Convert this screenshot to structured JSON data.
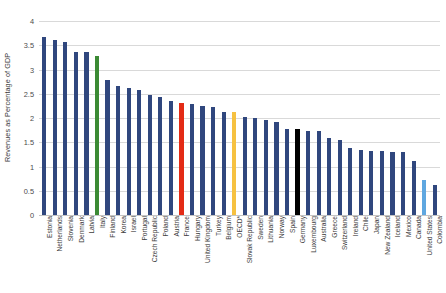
{
  "chart_data": {
    "type": "bar",
    "title": "",
    "subtitle": "",
    "xlabel": "",
    "ylabel": "Revenues as Percentage of GDP",
    "ylim": [
      0,
      4
    ],
    "yticks": [
      "0",
      "0.5",
      "1",
      "1.5",
      "2",
      "2.5",
      "3",
      "3.5",
      "4"
    ],
    "ytick_values": [
      0,
      0.5,
      1,
      1.5,
      2,
      2.5,
      3,
      3.5,
      4
    ],
    "grid": true,
    "legend": "none",
    "bar_default_color": "#30477e",
    "highlight_colors": {
      "italy": "#3b8a34",
      "france": "#e32b16",
      "oecd": "#f6c141",
      "germany": "#000000",
      "united_states": "#5fa7e0"
    },
    "categories": [
      "Estonia",
      "Netherlands",
      "Slovenia",
      "Denmark",
      "Latvia",
      "Italy",
      "Finland",
      "Korea",
      "Israel",
      "Portugal",
      "Czech Republic",
      "Poland",
      "Austria",
      "France",
      "Hungary",
      "United Kingdom",
      "Turkey",
      "Belgium",
      "OECD*",
      "Slovak Republic",
      "Sweden",
      "Lithuania",
      "Norway",
      "Spain",
      "Germany",
      "Luxembourg",
      "Australia",
      "Greece",
      "Switzerland",
      "Ireland",
      "Chile",
      "Japan",
      "New Zealand",
      "Iceland",
      "Mexico",
      "Canada",
      "United States",
      "Colombia"
    ],
    "values": [
      3.68,
      3.61,
      3.57,
      3.37,
      3.37,
      3.27,
      2.79,
      2.66,
      2.62,
      2.58,
      2.47,
      2.44,
      2.36,
      2.31,
      2.28,
      2.25,
      2.22,
      2.13,
      2.13,
      2.02,
      2.01,
      1.96,
      1.91,
      1.77,
      1.78,
      1.74,
      1.74,
      1.58,
      1.55,
      1.39,
      1.34,
      1.31,
      1.31,
      1.29,
      1.29,
      1.11,
      0.72,
      0.61
    ],
    "colors": [
      "#30477e",
      "#30477e",
      "#30477e",
      "#30477e",
      "#30477e",
      "#3b8a34",
      "#30477e",
      "#30477e",
      "#30477e",
      "#30477e",
      "#30477e",
      "#30477e",
      "#30477e",
      "#e32b16",
      "#30477e",
      "#30477e",
      "#30477e",
      "#30477e",
      "#f6c141",
      "#30477e",
      "#30477e",
      "#30477e",
      "#30477e",
      "#30477e",
      "#000000",
      "#30477e",
      "#30477e",
      "#30477e",
      "#30477e",
      "#30477e",
      "#30477e",
      "#30477e",
      "#30477e",
      "#30477e",
      "#30477e",
      "#30477e",
      "#5fa7e0",
      "#30477e"
    ]
  }
}
